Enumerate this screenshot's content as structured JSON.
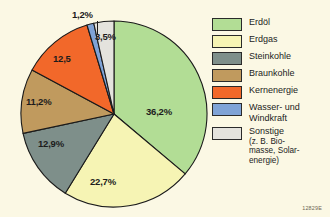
{
  "figure": {
    "background_color": "#fbf8e4",
    "source_code": "12829E"
  },
  "chart_data": {
    "type": "pie",
    "title": "",
    "subtitle": "",
    "xlabel": "",
    "ylabel": "",
    "grid": false,
    "legend_position": "right",
    "start_angle_deg": 0,
    "direction": "clockwise",
    "categories": [
      "Erdöl",
      "Erdgas",
      "Steinkohle",
      "Braunkohle",
      "Kernenergie",
      "Wasser- und Windkraft",
      "Sonstige (z. B. Biomasse, Solarenergie)"
    ],
    "values": [
      36.2,
      22.7,
      12.9,
      11.2,
      12.5,
      1.2,
      3.5
    ],
    "value_labels": [
      "36,2%",
      "22,7%",
      "12,9%",
      "11,2%",
      "12,5",
      "1,2%",
      "3,5%"
    ],
    "colors": [
      "#b2dd95",
      "#f6f4b4",
      "#7e8f8a",
      "#c09a5e",
      "#f2682a",
      "#7fa3d6",
      "#e4e3dd"
    ],
    "units": "percent"
  },
  "legend": {
    "items": [
      {
        "label": "Erdöl",
        "sub": "",
        "color": "#b2dd95",
        "swatch_name": "legend-swatch-erdoel"
      },
      {
        "label": "Erdgas",
        "sub": "",
        "color": "#f6f4b4",
        "swatch_name": "legend-swatch-erdgas"
      },
      {
        "label": "Steinkohle",
        "sub": "",
        "color": "#7e8f8a",
        "swatch_name": "legend-swatch-steinkohle"
      },
      {
        "label": "Braunkohle",
        "sub": "",
        "color": "#c09a5e",
        "swatch_name": "legend-swatch-braunkohle"
      },
      {
        "label": "Kernenergie",
        "sub": "",
        "color": "#f2682a",
        "swatch_name": "legend-swatch-kernenergie"
      },
      {
        "label": "Wasser- und\nWindkraft",
        "sub": "",
        "color": "#7fa3d6",
        "swatch_name": "legend-swatch-wasserwind"
      },
      {
        "label": "Sonstige",
        "sub": "(z. B. Bio-\nmasse, Solar-\nenergie)",
        "color": "#e4e3dd",
        "swatch_name": "legend-swatch-sonstige"
      }
    ]
  },
  "pie_labels": {
    "erdoel": "36,2%",
    "erdgas": "22,7%",
    "steinkohle": "12,9%",
    "braunkohle": "11,2%",
    "kernenergie": "12,5",
    "wasser_wind": "1,2%",
    "sonstige": "3,5%"
  }
}
